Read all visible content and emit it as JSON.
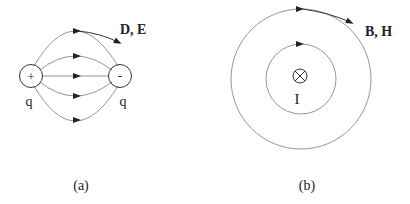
{
  "panel_a": {
    "caption": "(a)",
    "field_label": "D, E",
    "positive_charge": {
      "symbol": "+",
      "label": "q"
    },
    "negative_charge": {
      "symbol": "-",
      "label": "q"
    },
    "field_lines": 5
  },
  "panel_b": {
    "caption": "(b)",
    "field_label": "B, H",
    "current_symbol": "⊗",
    "current_label": "I",
    "field_circles": 2
  },
  "colors": {
    "line": "#8a8a8a",
    "text": "#222222"
  }
}
